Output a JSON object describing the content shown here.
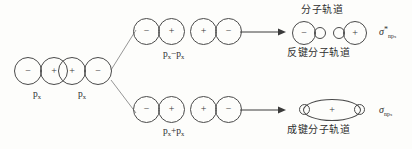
{
  "figure": {
    "background_color": "#fdfdfb",
    "stroke_color": "#4a4a4a"
  },
  "reactants": {
    "left_pair": {
      "label": "p",
      "subscript": "x",
      "signs": [
        "−",
        "+"
      ]
    },
    "right_pair": {
      "label": "p",
      "subscript": "x",
      "signs": [
        "+",
        "−"
      ]
    }
  },
  "branches": {
    "top": {
      "combination_label": "p",
      "combination_sub": "x",
      "combination_op": "−",
      "combination_label2": "p",
      "combination_sub2": "x",
      "pair_a_signs": [
        "−",
        "+"
      ],
      "pair_b_signs": [
        "+",
        "−"
      ],
      "result_title": "分子轨道",
      "result_caption": "反键分子轨道",
      "result_signs": [
        "−",
        "+"
      ],
      "orbital_symbol": "σ",
      "orbital_sup": "*",
      "orbital_sub": "np",
      "orbital_sub2": "x"
    },
    "bottom": {
      "combination_label": "p",
      "combination_sub": "x",
      "combination_op": "+",
      "combination_label2": "p",
      "combination_sub2": "x",
      "pair_a_signs": [
        "−",
        "+"
      ],
      "pair_b_signs": [
        "+",
        "−"
      ],
      "result_caption": "成键分子轨道",
      "result_signs": [
        "+"
      ],
      "orbital_symbol": "σ",
      "orbital_sup": "",
      "orbital_sub": "np",
      "orbital_sub2": "x"
    }
  },
  "icons": {
    "arrow_top": "right-arrow-icon",
    "arrow_bottom": "right-arrow-icon",
    "branch_up": "branch-line-icon",
    "branch_down": "branch-line-icon"
  }
}
